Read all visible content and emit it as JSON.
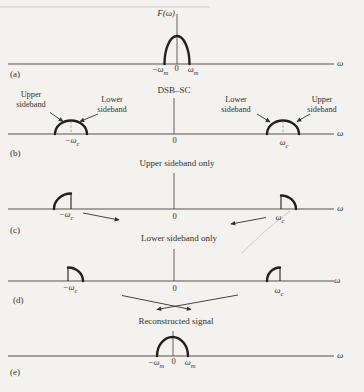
{
  "colors": {
    "background": "#f3f2ee",
    "ink": "#33312c",
    "line": "#56534d",
    "curve": "#23211d"
  },
  "figure": {
    "panel_a": {
      "tag": "(a)",
      "ylabel": "F(ω)",
      "xlabel": "ω",
      "tick_neg_base": "−ω",
      "tick_neg_sub": "m",
      "tick_zero": "0",
      "tick_pos_base": "ω",
      "tick_pos_sub": "m"
    },
    "panel_b": {
      "tag": "(b)",
      "title": "DSB–SC",
      "xlabel": "ω",
      "label_upper_left": "Upper sideband",
      "label_lower_left": "Lower sideband",
      "label_lower_right": "Lower sideband",
      "label_upper_right": "Upper sideband",
      "tick_neg_base": "−ω",
      "tick_neg_sub": "c",
      "tick_zero": "0",
      "tick_pos_base": "ω",
      "tick_pos_sub": "c"
    },
    "panel_c": {
      "tag": "(c)",
      "title": "Upper sideband only",
      "xlabel": "ω",
      "tick_neg_base": "−ω",
      "tick_neg_sub": "c",
      "tick_zero": "0",
      "tick_pos_base": "ω",
      "tick_pos_sub": "c"
    },
    "panel_d": {
      "tag": "(d)",
      "title": "Lower sideband only",
      "xlabel": "ω",
      "tick_neg_base": "−ω",
      "tick_neg_sub": "c",
      "tick_zero": "0",
      "tick_pos_base": "ω",
      "tick_pos_sub": "c"
    },
    "panel_e": {
      "tag": "(e)",
      "title": "Reconstructed signal",
      "xlabel": "ω",
      "tick_neg_base": "−ω",
      "tick_neg_sub": "m",
      "tick_zero": "0",
      "tick_pos_base": "ω",
      "tick_pos_sub": "m"
    }
  }
}
